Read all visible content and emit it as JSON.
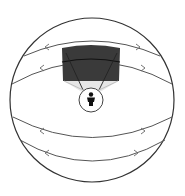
{
  "diagram": {
    "type": "viewing-sphere",
    "background": "#ffffff",
    "sphere": {
      "cx": 92,
      "cy": 100,
      "r": 82,
      "stroke": "#333333"
    },
    "latitude_arcs": [
      {
        "id": "arc-upper-1",
        "d": "M 24 56 Q 92 26 160 56",
        "arrows": [
          {
            "x": 45,
            "y": 47,
            "dir": "left"
          },
          {
            "x": 140,
            "y": 47,
            "dir": "right"
          }
        ]
      },
      {
        "id": "arc-upper-2",
        "d": "M 12 84 Q 92 40 172 84",
        "arrows": [
          {
            "x": 40,
            "y": 68,
            "dir": "left"
          },
          {
            "x": 145,
            "y": 68,
            "dir": "right"
          }
        ]
      },
      {
        "id": "arc-lower-1",
        "d": "M 13 117 Q 92 158 172 117",
        "arrows": [
          {
            "x": 40,
            "y": 131,
            "dir": "left"
          },
          {
            "x": 145,
            "y": 131,
            "dir": "right"
          }
        ]
      },
      {
        "id": "arc-lower-2",
        "d": "M 20 140 Q 92 182 165 140",
        "arrows": [
          {
            "x": 45,
            "y": 153,
            "dir": "left"
          },
          {
            "x": 138,
            "y": 153,
            "dir": "right"
          }
        ]
      }
    ],
    "arc_color": "#555555",
    "viewport_panel": {
      "color": "#3a3a3a",
      "shadow_color": "#e6e6e6"
    },
    "viewer": {
      "cx": 91,
      "cy": 100,
      "r": 12,
      "fill": "#ffffff",
      "stroke": "#444444",
      "figure_color": "#111111"
    }
  }
}
